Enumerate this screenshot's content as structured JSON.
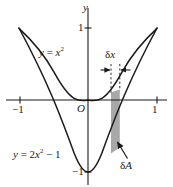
{
  "figure": {
    "background_color": "#ffffff",
    "ink_color": "#1a1a1a",
    "strip_fill_color": "#a8a8a8",
    "width": 173,
    "height": 187
  },
  "axes": {
    "y_axis_label": "y",
    "origin_label": "O",
    "x_ticks": [
      {
        "value": -1,
        "label": "−1"
      },
      {
        "value": 1,
        "label": "1"
      }
    ],
    "y_ticks": [
      {
        "value": 1,
        "label": "1"
      },
      {
        "value": -1,
        "label": "−1"
      }
    ],
    "xlim": [
      -1.18,
      1.18
    ],
    "ylim": [
      -1.18,
      1.18
    ]
  },
  "curves": [
    {
      "name": "upper-parabola",
      "equation": "y = x²",
      "label_lhs": "y",
      "label_eq": "=",
      "label_base": "x",
      "label_exp": "2",
      "coefficient": 1,
      "constant": 0
    },
    {
      "name": "lower-parabola",
      "equation": "y = 2x² − 1",
      "label_lhs": "y",
      "label_eq": "=",
      "label_coef": "2",
      "label_base": "x",
      "label_exp": "2",
      "label_tail": "− 1",
      "coefficient": 2,
      "constant": -1
    }
  ],
  "annotations": {
    "delta_x": {
      "label_delta": "δ",
      "label_var": "x",
      "text": "δx",
      "x_left": 0.32,
      "x_right": 0.47
    },
    "delta_a": {
      "label_delta": "δ",
      "label_var": "A",
      "text": "δA"
    },
    "strip": {
      "name": "area-element-strip",
      "x_left": 0.32,
      "x_right": 0.47,
      "top_curve": "upper-parabola",
      "bottom_curve": "lower-parabola"
    }
  }
}
